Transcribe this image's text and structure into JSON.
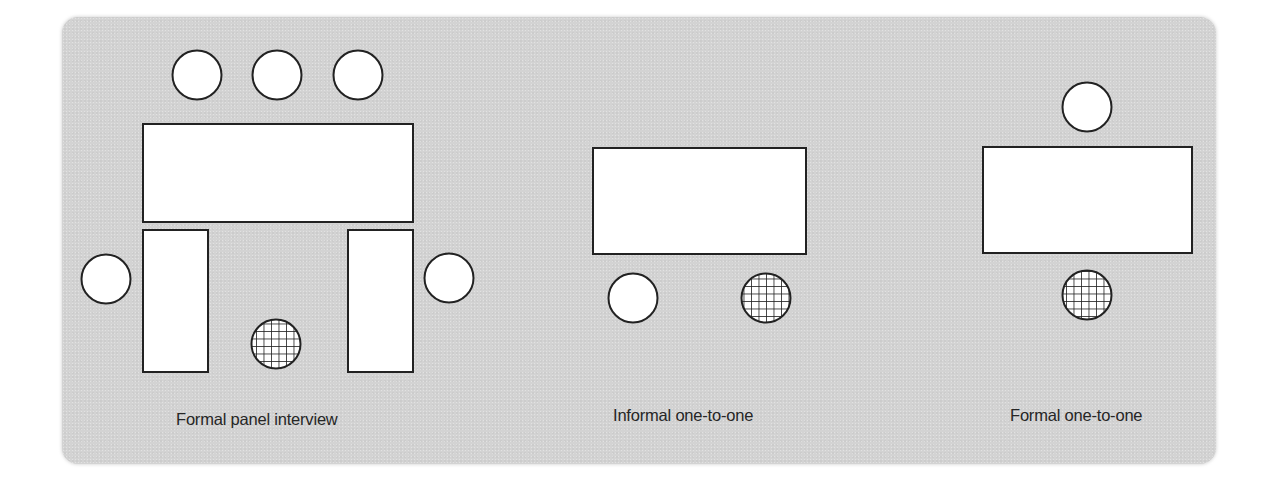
{
  "diagram": {
    "colors": {
      "background": "#ffffff",
      "panel": "#d3d3d3",
      "shape_fill": "#ffffff",
      "stroke": "#222222",
      "label_text": "#262626"
    },
    "legend": {
      "plain_circle": "interviewer",
      "hatched_circle": "candidate",
      "rectangle": "table"
    },
    "layouts": [
      {
        "id": "formal-panel-interview",
        "label": "Formal panel interview",
        "tables": [
          {
            "name": "main-table",
            "x": 143,
            "y": 124,
            "w": 270,
            "h": 98
          },
          {
            "name": "left-side-table",
            "x": 143,
            "y": 230,
            "w": 65,
            "h": 142
          },
          {
            "name": "right-side-table",
            "x": 348,
            "y": 230,
            "w": 65,
            "h": 142
          }
        ],
        "interviewers": [
          {
            "cx": 197,
            "cy": 75
          },
          {
            "cx": 277,
            "cy": 75
          },
          {
            "cx": 358,
            "cy": 75
          },
          {
            "cx": 106,
            "cy": 279
          },
          {
            "cx": 449,
            "cy": 278
          }
        ],
        "candidate": {
          "cx": 276,
          "cy": 344
        }
      },
      {
        "id": "informal-one-to-one",
        "label": "Informal one-to-one",
        "tables": [
          {
            "name": "table",
            "x": 593,
            "y": 148,
            "w": 213,
            "h": 106
          }
        ],
        "interviewers": [
          {
            "cx": 633,
            "cy": 298
          }
        ],
        "candidate": {
          "cx": 766,
          "cy": 298
        }
      },
      {
        "id": "formal-one-to-one",
        "label": "Formal one-to-one",
        "tables": [
          {
            "name": "table",
            "x": 983,
            "y": 147,
            "w": 209,
            "h": 106
          }
        ],
        "interviewers": [
          {
            "cx": 1087,
            "cy": 107
          }
        ],
        "candidate": {
          "cx": 1087,
          "cy": 295
        }
      }
    ]
  }
}
